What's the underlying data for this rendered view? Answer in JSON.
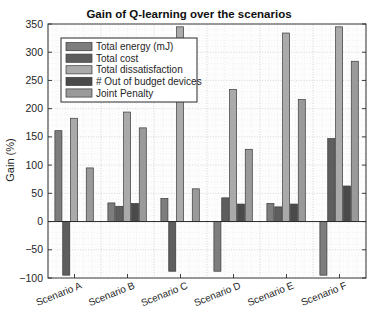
{
  "chart_data": {
    "type": "bar",
    "title": "Gain of Q-learning over the scenarios",
    "xlabel": "",
    "ylabel": "Gain (%)",
    "ylim": [
      -100,
      350
    ],
    "yticks": [
      -100,
      -50,
      0,
      50,
      100,
      150,
      200,
      250,
      300,
      350
    ],
    "ytick_labels": [
      "−100",
      "−50",
      "0",
      "50",
      "100",
      "150",
      "200",
      "250",
      "300",
      "350"
    ],
    "grid": true,
    "legend_position": "upper-left-inside",
    "categories": [
      "Scenario A",
      "Scenario B",
      "Scenario C",
      "Scenario D",
      "Scenario E",
      "Scenario F"
    ],
    "series": [
      {
        "name": "Total energy (mJ)",
        "color": "#7d7d7d",
        "values": [
          161,
          33,
          41,
          -88,
          32,
          -95
        ]
      },
      {
        "name": "Total cost",
        "color": "#5e5e5e",
        "values": [
          -95,
          27,
          -88,
          42,
          26,
          147
        ]
      },
      {
        "name": "Total dissatisfaction",
        "color": "#aaaaaa",
        "values": [
          183,
          194,
          345,
          234,
          334,
          345
        ]
      },
      {
        "name": "# Out of budget devices",
        "color": "#4a4a4a",
        "values": [
          0,
          32,
          0,
          31,
          31,
          63
        ]
      },
      {
        "name": "Joint Penalty",
        "color": "#9a9a9a",
        "values": [
          95,
          166,
          58,
          128,
          216,
          284
        ]
      }
    ]
  },
  "axis": {
    "ylabel": "Gain (%)",
    "title": "Gain of Q-learning over the scenarios"
  }
}
